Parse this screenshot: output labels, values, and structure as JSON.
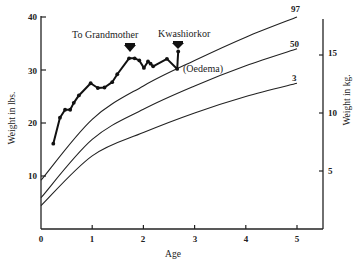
{
  "chart_data": {
    "type": "line",
    "title": "",
    "xlabel": "Age",
    "ylabel": "Weight in lbs.",
    "ylabel_right": "Weight in kg.",
    "xlim": [
      0,
      5.5
    ],
    "ylim": [
      0,
      40
    ],
    "xticks": [
      0,
      1,
      2,
      3,
      4,
      5
    ],
    "yticks": [
      10,
      20,
      30,
      40
    ],
    "yticks_right": [
      5,
      10,
      15
    ],
    "grid": false,
    "legend": "none",
    "series": [
      {
        "name": "Child weight",
        "style": "line-with-markers",
        "x": [
          0.24,
          0.37,
          0.47,
          0.57,
          0.64,
          0.74,
          0.97,
          1.11,
          1.24,
          1.39,
          1.49,
          1.72,
          1.83,
          1.92,
          2.01,
          2.09,
          2.14,
          2.19,
          2.46,
          2.66,
          2.68
        ],
        "y": [
          16.1,
          21.0,
          22.5,
          22.5,
          23.8,
          25.2,
          27.5,
          26.6,
          26.7,
          27.7,
          29.2,
          32.2,
          32.2,
          31.8,
          30.4,
          31.6,
          31.2,
          30.7,
          32.1,
          30.2,
          33.5
        ]
      },
      {
        "name": "97",
        "style": "curve",
        "x": [
          0,
          1,
          2,
          3,
          4,
          5
        ],
        "y": [
          9.2,
          20.7,
          27.0,
          31.8,
          36.2,
          40.0
        ]
      },
      {
        "name": "50",
        "style": "curve",
        "x": [
          0,
          1,
          2,
          3,
          4,
          5
        ],
        "y": [
          5.9,
          16.9,
          22.6,
          27.0,
          30.8,
          34.0
        ]
      },
      {
        "name": "3",
        "style": "curve",
        "x": [
          0,
          1,
          2,
          3,
          4,
          5
        ],
        "y": [
          4.4,
          13.8,
          18.2,
          21.9,
          25.0,
          27.5
        ]
      }
    ],
    "annotations": [
      {
        "text": "To Grandmother",
        "age": 1.7,
        "marker": "down-arrow"
      },
      {
        "text": "Kwashiorkor",
        "age": 2.68,
        "marker": "down-arrow"
      },
      {
        "text": "(Oedema)",
        "age": 2.7
      }
    ]
  },
  "labels": {
    "x_title": "Age",
    "y_title_left": "Weight in lbs.",
    "y_title_right": "Weight in kg.",
    "xticks": [
      "0",
      "1",
      "2",
      "3",
      "4",
      "5"
    ],
    "yticks_left": [
      "10",
      "20",
      "30",
      "40"
    ],
    "yticks_right": [
      "5",
      "10",
      "15"
    ],
    "curve_97": "97",
    "curve_50": "50",
    "curve_3": "3",
    "annot_grandmother": "To Grandmother",
    "annot_kwashiorkor": "Kwashiorkor",
    "annot_oedema": "(Oedema)"
  }
}
